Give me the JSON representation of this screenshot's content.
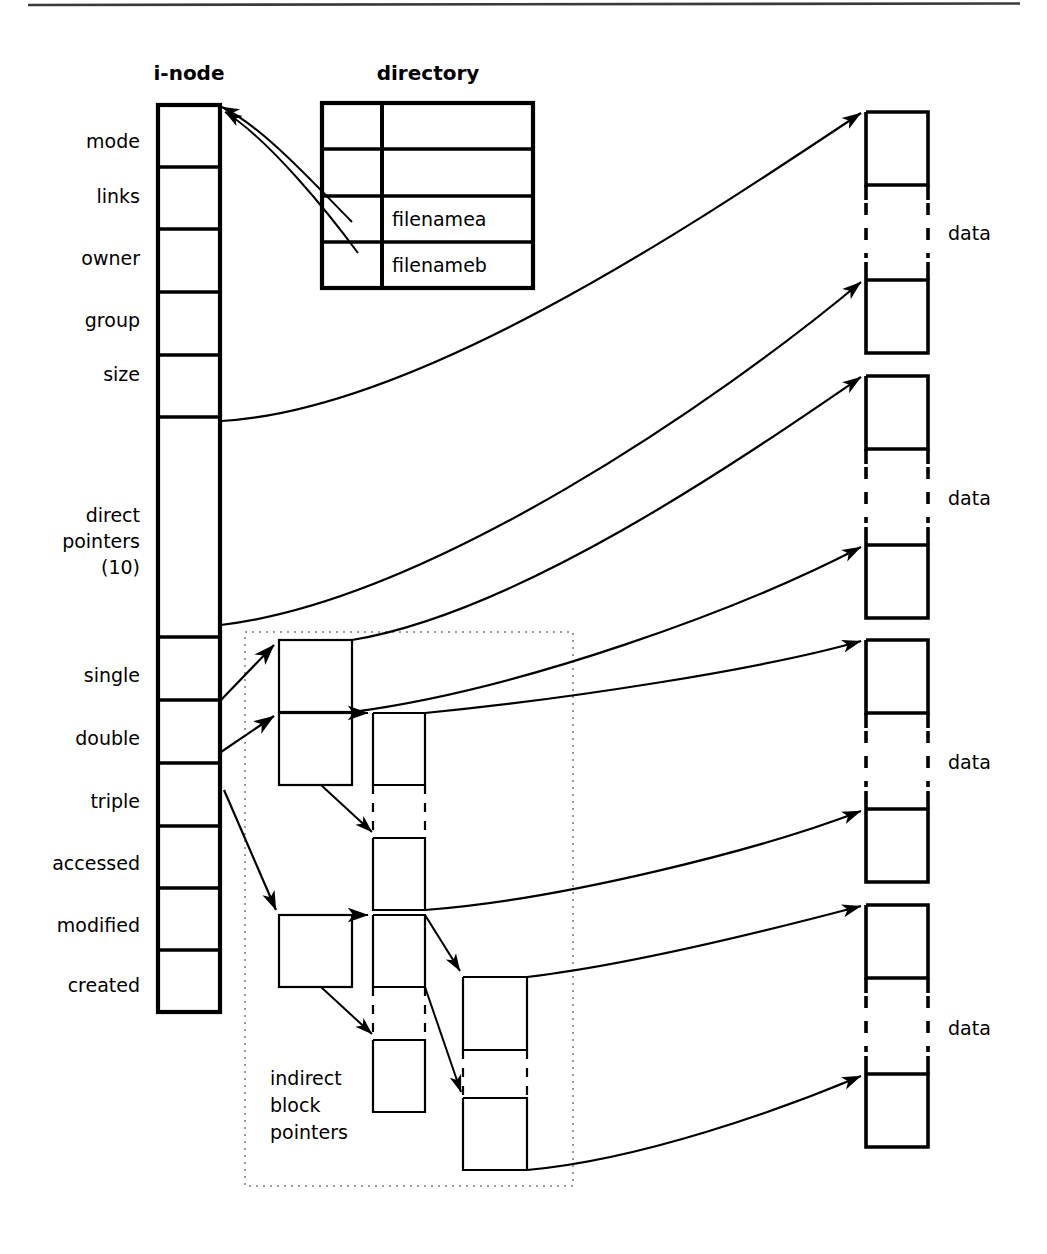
{
  "figure": {
    "kind": "unix-inode-file-structure-diagram",
    "page_rule": true
  },
  "headings": {
    "inode": "i-node",
    "directory": "directory"
  },
  "inode": {
    "fields": [
      {
        "label": "mode"
      },
      {
        "label": "links"
      },
      {
        "label": "owner"
      },
      {
        "label": "group"
      },
      {
        "label": "size"
      },
      {
        "label": "direct\npointers\n(10)",
        "lines": [
          "direct",
          "pointers",
          "(10)"
        ]
      },
      {
        "label": "single"
      },
      {
        "label": "double"
      },
      {
        "label": "triple"
      },
      {
        "label": "accessed"
      },
      {
        "label": "modified"
      },
      {
        "label": "created"
      }
    ]
  },
  "directory": {
    "columns": [
      "inode-number",
      "filename"
    ],
    "rows": [
      {
        "inode": "",
        "name": ""
      },
      {
        "inode": "",
        "name": ""
      },
      {
        "inode": "",
        "name": "filenamea"
      },
      {
        "inode": "",
        "name": "filenameb"
      }
    ]
  },
  "indirect": {
    "caption_lines": [
      "indirect",
      "block",
      "pointers"
    ],
    "caption": "indirect block pointers"
  },
  "data_blocks": {
    "labels": [
      "data",
      "data",
      "data",
      "data"
    ]
  },
  "colors": {
    "ink": "#000000",
    "paper": "#ffffff",
    "rule": "#2b2b2b",
    "dotted": "#8a8a8a"
  }
}
